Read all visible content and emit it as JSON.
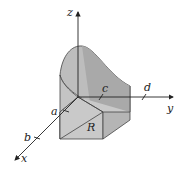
{
  "diagram": {
    "axes": {
      "x_label": "x",
      "y_label": "y",
      "z_label": "z"
    },
    "ticks": {
      "a": "a",
      "b": "b",
      "c": "c",
      "d": "d"
    },
    "region_label": "R",
    "colors": {
      "solid_fill": "#bdbdbd",
      "solid_dark": "#a9a9a9",
      "stroke": "#333333"
    }
  }
}
